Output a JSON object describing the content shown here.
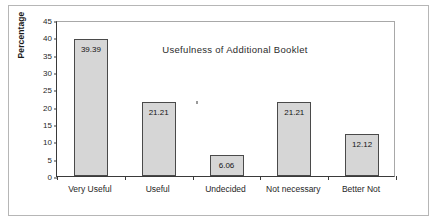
{
  "chart_data": {
    "type": "bar",
    "title": "Usefulness of Additional Booklet",
    "xlabel": "",
    "ylabel": "Percentage",
    "categories": [
      "Very Useful",
      "Useful",
      "Undecided",
      "Not necessary",
      "Better Not"
    ],
    "values": [
      39.39,
      21.21,
      6.06,
      21.21,
      12.12
    ],
    "value_labels": [
      "39.39",
      "21.21",
      "6.06",
      "21.21",
      "12.12"
    ],
    "ylim": [
      0,
      45
    ],
    "yticks": [
      0,
      5,
      10,
      15,
      20,
      25,
      30,
      35,
      40,
      45
    ],
    "ytick_labels": [
      "0",
      "5",
      "10",
      "15",
      "20",
      "25",
      "30",
      "35",
      "40",
      "45"
    ],
    "grid": false,
    "legend": false,
    "bar_fill_color": "#d6d6d6",
    "bar_border_color": "#4a4a4a",
    "axis_color": "#3a3a3a",
    "plot_background": "#ffffff",
    "frame_border_color": "#b6b6b6"
  }
}
